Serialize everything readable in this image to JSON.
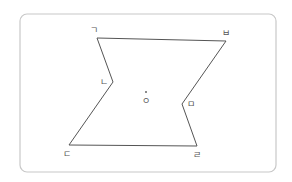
{
  "diagram": {
    "frame": {
      "x": 20,
      "y": 14,
      "width": 256,
      "height": 158,
      "radius": 7,
      "stroke": "#c8c8c8"
    },
    "shape": {
      "type": "hexagon",
      "stroke": "#555555",
      "vertices": [
        {
          "label": "ㄱ",
          "x": 97,
          "y": 38,
          "label_x": 94,
          "label_y": 33
        },
        {
          "label": "ㅂ",
          "x": 226,
          "y": 41,
          "label_x": 226,
          "label_y": 36
        },
        {
          "label": "ㅁ",
          "x": 182,
          "y": 104,
          "label_x": 191,
          "label_y": 107
        },
        {
          "label": "ㄹ",
          "x": 197,
          "y": 146,
          "label_x": 197,
          "label_y": 158
        },
        {
          "label": "ㄷ",
          "x": 69,
          "y": 145,
          "label_x": 67,
          "label_y": 157
        },
        {
          "label": "ㄴ",
          "x": 113,
          "y": 82,
          "label_x": 104,
          "label_y": 85
        }
      ]
    },
    "center": {
      "label": "ㅇ",
      "dot_x": 146,
      "dot_y": 92,
      "label_x": 146,
      "label_y": 104
    }
  }
}
